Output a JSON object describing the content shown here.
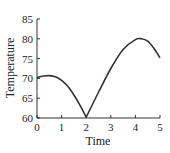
{
  "chart_data": {
    "type": "line",
    "title": "",
    "xlabel": "Time",
    "ylabel": "Temperature",
    "xlim": [
      0,
      5
    ],
    "ylim": [
      60,
      85
    ],
    "xticks": [
      "0",
      "1",
      "2",
      "3",
      "4",
      "5"
    ],
    "yticks": [
      "60",
      "65",
      "70",
      "75",
      "80",
      "85"
    ],
    "grid": false,
    "legend": null,
    "series": [
      {
        "name": "Temperature",
        "color": "#333333",
        "x": [
          0,
          0.25,
          0.5,
          0.75,
          1.0,
          1.25,
          1.5,
          1.75,
          2.0,
          2.5,
          3.0,
          3.5,
          4.0,
          4.25,
          4.5,
          4.75,
          5.0
        ],
        "y": [
          70.2,
          70.6,
          70.7,
          70.4,
          69.5,
          68.0,
          65.8,
          63.2,
          60.2,
          66.5,
          72.5,
          77.3,
          79.8,
          80.0,
          79.4,
          77.6,
          75.2
        ]
      }
    ]
  }
}
